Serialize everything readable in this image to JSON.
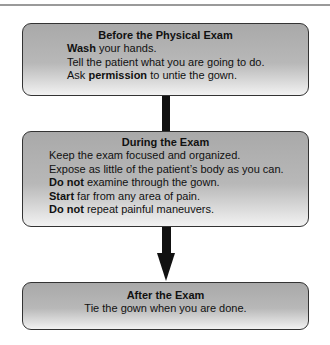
{
  "colors": {
    "box_border": "#333333",
    "box_fill_top": "#a9a9a9",
    "box_fill_bottom": "#f2f2f2",
    "arrow": "#111111",
    "rule": "#9a9a9a"
  },
  "boxes": [
    {
      "title": "Before the Physical Exam",
      "lines": [
        {
          "bold": "Wash",
          "rest": " your hands."
        },
        {
          "bold": "",
          "rest": "Tell the patient what you are going to do."
        },
        {
          "pre": "Ask ",
          "bold": "permission",
          "rest": " to untie the gown."
        }
      ]
    },
    {
      "title": "During the Exam",
      "lines": [
        {
          "bold": "",
          "rest": "Keep the exam focused and organized."
        },
        {
          "bold": "",
          "rest": "Expose as little of the patient’s body as you can."
        },
        {
          "bold": "Do not",
          "rest": " examine through the gown."
        },
        {
          "bold": "Start",
          "rest": " far from any area of pain."
        },
        {
          "bold": "Do not",
          "rest": " repeat painful maneuvers."
        }
      ]
    },
    {
      "title": "After the Exam",
      "lines": [
        {
          "bold": "",
          "rest": "Tie the gown when you are done."
        }
      ]
    }
  ],
  "connectors": [
    {
      "from": "Before the Physical Exam",
      "to": "During the Exam",
      "type": "line"
    },
    {
      "from": "During the Exam",
      "to": "After the Exam",
      "type": "arrow"
    }
  ]
}
